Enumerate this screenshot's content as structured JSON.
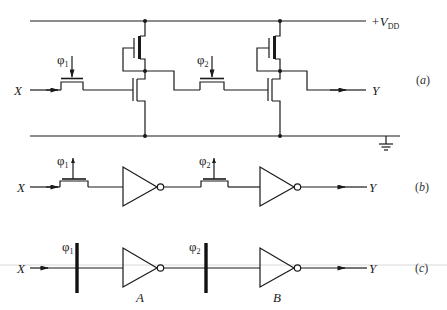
{
  "figure": {
    "parts": [
      {
        "id": "a",
        "caption": "(a)",
        "caption_letter": "a",
        "description": "Two-phase dynamic shift register stage: NMOS pass transistors clocked by phi1 and phi2, each feeding a depletion-load NMOS inverter between +VDD and ground",
        "supply_label": "+V",
        "supply_subscript": "DD",
        "input_label": "X",
        "output_label": "Y",
        "clock_1": {
          "symbol": "φ",
          "subscript": "1"
        },
        "clock_2": {
          "symbol": "φ",
          "subscript": "2"
        }
      },
      {
        "id": "b",
        "caption": "(b)",
        "caption_letter": "b",
        "description": "Same circuit with pass transistors and inverter symbols",
        "input_label": "X",
        "output_label": "Y",
        "clock_1": {
          "symbol": "φ",
          "subscript": "1"
        },
        "clock_2": {
          "symbol": "φ",
          "subscript": "2"
        }
      },
      {
        "id": "c",
        "caption": "(c)",
        "caption_letter": "c",
        "description": "Abstract representation: clock barriers phi1 and phi2 before inverters A and B",
        "input_label": "X",
        "output_label": "Y",
        "clock_1": {
          "symbol": "φ",
          "subscript": "1"
        },
        "clock_2": {
          "symbol": "φ",
          "subscript": "2"
        },
        "inverter_1_label": "A",
        "inverter_2_label": "B"
      }
    ],
    "colors": {
      "ink": "#1a1a1a",
      "background": "#ffffff"
    }
  }
}
